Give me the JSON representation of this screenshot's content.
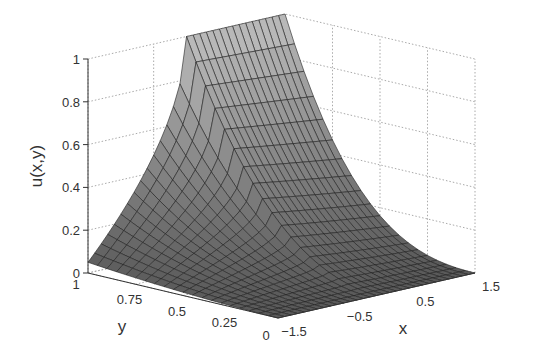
{
  "chart_data": {
    "type": "surface",
    "title": "",
    "xlabel": "x",
    "ylabel": "y",
    "zlabel": "u(x,y)",
    "xlim": [
      -1.5,
      1.5
    ],
    "ylim": [
      0,
      1
    ],
    "zlim": [
      0,
      1
    ],
    "x_ticks": [
      "-1.5",
      "-0.5",
      "0.5",
      "1.5"
    ],
    "x_tick_values": [
      -1.5,
      -0.5,
      0.5,
      1.5
    ],
    "y_ticks": [
      "0",
      "0.25",
      "0.5",
      "0.75",
      "1"
    ],
    "y_tick_values": [
      0,
      0.25,
      0.5,
      0.75,
      1
    ],
    "z_ticks": [
      "0",
      "0.2",
      "0.4",
      "0.6",
      "0.8",
      "1"
    ],
    "z_tick_values": [
      0,
      0.2,
      0.4,
      0.6,
      0.8,
      1
    ],
    "grid": true,
    "colormap": "gray",
    "mesh": {
      "nx": 31,
      "ny": 21
    }
  },
  "labels": {
    "x": "x",
    "y": "y",
    "z": "u(x,y)"
  }
}
